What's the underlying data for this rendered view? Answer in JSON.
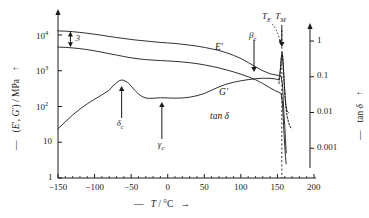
{
  "chart_data": {
    "type": "line",
    "title": "",
    "xlabel": "T / °C",
    "ylabel_left": "(E′, G′) / MPa",
    "ylabel_right": "tan δ",
    "xlim": [
      -150,
      200
    ],
    "xticks": [
      "-150",
      "-100",
      "-50",
      "0",
      "50",
      "100",
      "150",
      "200"
    ],
    "xtick_values": [
      -150,
      -100,
      -50,
      0,
      50,
      100,
      150,
      200
    ],
    "yscale": "log",
    "ylim_left": [
      1,
      30000
    ],
    "yticks_left": [
      "10",
      "10",
      "10",
      "10",
      "1"
    ],
    "yticks_left_mantissa": [
      "10",
      "10",
      "10",
      "10",
      "1"
    ],
    "yticks_left_exp": [
      "4",
      "3",
      "2",
      "",
      ""
    ],
    "ytick_left_values": [
      10000,
      1000,
      100,
      10,
      1
    ],
    "ylim_right": [
      0.0003,
      3
    ],
    "yticks_right": [
      "1",
      "0.1",
      "0.01",
      "0.001"
    ],
    "ytick_right_values": [
      1,
      0.1,
      0.01,
      0.001
    ],
    "grid": false,
    "legend_position": "inline-curve-labels",
    "series": [
      {
        "name": "E′",
        "axis": "left",
        "label": "E′",
        "style": "solid",
        "points": [
          [
            -150,
            13000
          ],
          [
            -140,
            12800
          ],
          [
            -130,
            12400
          ],
          [
            -120,
            11800
          ],
          [
            -110,
            11200
          ],
          [
            -100,
            10500
          ],
          [
            -90,
            9800
          ],
          [
            -80,
            9100
          ],
          [
            -70,
            8500
          ],
          [
            -60,
            8000
          ],
          [
            -50,
            7500
          ],
          [
            -40,
            7100
          ],
          [
            -30,
            6800
          ],
          [
            -20,
            6500
          ],
          [
            -10,
            6200
          ],
          [
            0,
            6000
          ],
          [
            10,
            5800
          ],
          [
            20,
            5500
          ],
          [
            30,
            5200
          ],
          [
            40,
            4900
          ],
          [
            50,
            4500
          ],
          [
            60,
            4100
          ],
          [
            70,
            3700
          ],
          [
            80,
            3200
          ],
          [
            90,
            2700
          ],
          [
            100,
            2200
          ],
          [
            110,
            1700
          ],
          [
            120,
            1300
          ],
          [
            130,
            1000
          ],
          [
            140,
            820
          ],
          [
            148,
            760
          ],
          [
            152,
            740
          ],
          [
            155,
            700
          ],
          [
            157,
            400
          ],
          [
            158,
            150
          ],
          [
            159,
            60
          ],
          [
            160,
            30
          ],
          [
            161,
            12
          ],
          [
            162,
            5
          ]
        ]
      },
      {
        "name": "G′",
        "axis": "left",
        "label": "G′",
        "style": "solid",
        "points": [
          [
            -150,
            4600
          ],
          [
            -140,
            4500
          ],
          [
            -130,
            4350
          ],
          [
            -120,
            4150
          ],
          [
            -110,
            3900
          ],
          [
            -100,
            3600
          ],
          [
            -90,
            3300
          ],
          [
            -80,
            3000
          ],
          [
            -70,
            2750
          ],
          [
            -60,
            2500
          ],
          [
            -50,
            2300
          ],
          [
            -40,
            2150
          ],
          [
            -30,
            2050
          ],
          [
            -20,
            1980
          ],
          [
            -10,
            1930
          ],
          [
            0,
            1880
          ],
          [
            10,
            1830
          ],
          [
            20,
            1760
          ],
          [
            30,
            1680
          ],
          [
            40,
            1580
          ],
          [
            50,
            1460
          ],
          [
            60,
            1330
          ],
          [
            70,
            1200
          ],
          [
            80,
            1060
          ],
          [
            90,
            930
          ],
          [
            100,
            800
          ],
          [
            110,
            680
          ],
          [
            120,
            560
          ],
          [
            130,
            440
          ],
          [
            140,
            330
          ],
          [
            148,
            270
          ],
          [
            152,
            250
          ],
          [
            155,
            230
          ],
          [
            157,
            120
          ],
          [
            158,
            45
          ],
          [
            159,
            18
          ],
          [
            160,
            8
          ],
          [
            161,
            4
          ],
          [
            162,
            2.5
          ]
        ]
      },
      {
        "name": "tan δ",
        "axis": "right",
        "label": "tan δ",
        "style": "solid",
        "points": [
          [
            -150,
            0.0035
          ],
          [
            -140,
            0.0055
          ],
          [
            -130,
            0.0085
          ],
          [
            -120,
            0.0125
          ],
          [
            -110,
            0.0175
          ],
          [
            -100,
            0.0235
          ],
          [
            -90,
            0.031
          ],
          [
            -80,
            0.042
          ],
          [
            -75,
            0.055
          ],
          [
            -70,
            0.068
          ],
          [
            -66,
            0.078
          ],
          [
            -63,
            0.081
          ],
          [
            -60,
            0.079
          ],
          [
            -55,
            0.07
          ],
          [
            -50,
            0.055
          ],
          [
            -45,
            0.042
          ],
          [
            -40,
            0.033
          ],
          [
            -35,
            0.028
          ],
          [
            -30,
            0.0255
          ],
          [
            -25,
            0.0248
          ],
          [
            -20,
            0.025
          ],
          [
            -15,
            0.0255
          ],
          [
            -10,
            0.0258
          ],
          [
            -5,
            0.0258
          ],
          [
            0,
            0.0255
          ],
          [
            10,
            0.0252
          ],
          [
            20,
            0.0255
          ],
          [
            30,
            0.0268
          ],
          [
            40,
            0.0295
          ],
          [
            50,
            0.034
          ],
          [
            60,
            0.042
          ],
          [
            70,
            0.052
          ],
          [
            80,
            0.062
          ],
          [
            90,
            0.07
          ],
          [
            100,
            0.077
          ],
          [
            110,
            0.083
          ],
          [
            120,
            0.088
          ],
          [
            130,
            0.091
          ],
          [
            140,
            0.09
          ],
          [
            147,
            0.087
          ],
          [
            151,
            0.082
          ],
          [
            153,
            0.1
          ],
          [
            154.5,
            0.2
          ],
          [
            155.5,
            0.38
          ],
          [
            156.5,
            0.48
          ],
          [
            157.5,
            0.3
          ],
          [
            158.5,
            0.13
          ],
          [
            159.5,
            0.055
          ],
          [
            160.5,
            0.028
          ],
          [
            161.5,
            0.016
          ],
          [
            163,
            0.011
          ],
          [
            165,
            0.01
          ]
        ]
      },
      {
        "name": "dotted-branch",
        "axis": "right",
        "label": "",
        "style": "dotted",
        "points": [
          [
            152,
            0.065
          ],
          [
            153,
            0.09
          ],
          [
            154,
            0.16
          ],
          [
            155,
            0.3
          ],
          [
            156,
            0.42
          ],
          [
            157,
            0.4
          ],
          [
            158,
            0.22
          ],
          [
            159,
            0.09
          ],
          [
            160,
            0.04
          ],
          [
            161,
            0.02
          ],
          [
            162,
            0.012
          ],
          [
            163.5,
            0.0075
          ],
          [
            165,
            0.0055
          ],
          [
            167,
            0.0042
          ],
          [
            169,
            0.0035
          ]
        ]
      }
    ],
    "annotations": [
      {
        "name": "beta-c",
        "text": "β",
        "subscript": "c",
        "x": 118,
        "arrow": "down",
        "target_series": "E′"
      },
      {
        "name": "delta-c",
        "text": "δ",
        "subscript": "c",
        "x": -63,
        "arrow": "up",
        "target_series": "tan δ"
      },
      {
        "name": "gamma-c",
        "text": "γ",
        "subscript": "c",
        "x": -8,
        "arrow": "up",
        "target_series": "tan δ"
      },
      {
        "name": "T-E",
        "text": "T",
        "subscript": "E",
        "x": 150,
        "arrow": "curved-down"
      },
      {
        "name": "T-M",
        "text": "T",
        "subscript": "M",
        "x": 156,
        "arrow": "down"
      },
      {
        "name": "factor-3",
        "text": "3",
        "x": -135,
        "arrow": "double-vertical",
        "meaning": "E′/G′ ratio ≈ 3"
      }
    ],
    "vertical_marker": {
      "name": "T-M-dotted-line",
      "x": 156,
      "style": "dotted"
    }
  },
  "axis": {
    "left_label_arrow_up": "↑",
    "left_label_dash": "—",
    "right_label_arrow_up": "↑",
    "right_label_dash": "—",
    "x_label_dash": "—",
    "x_label_arrow": "→"
  }
}
